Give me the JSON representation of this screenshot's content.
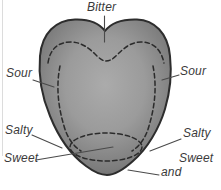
{
  "figure": {
    "labels": {
      "bitter": "Bitter",
      "sour_left": "Sour",
      "sour_right": "Sour",
      "salty_left": "Salty",
      "salty_right": "Salty",
      "sweet_left": "Sweet",
      "sweet_right_line1": "Sweet",
      "sweet_right_line2": "and"
    },
    "colors": {
      "background": "#ffffff",
      "tongue_center": "#aaaaaa",
      "tongue_edge": "#5f5f5f",
      "outline": "#2d2d2d",
      "dashed_boundary": "#2b2b2b",
      "leader_line": "#4a4a4a",
      "label_text": "#3a3a3a",
      "page_edge_line": "#dcdcdc"
    }
  }
}
